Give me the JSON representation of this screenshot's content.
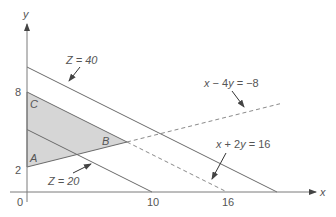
{
  "diagram": {
    "type": "linear-programming-feasible-region",
    "axes": {
      "x_label": "x",
      "y_label": "y",
      "origin_label": "0",
      "x_ticks": [
        "10",
        "16"
      ],
      "y_ticks": [
        "2",
        "8"
      ]
    },
    "vertices": [
      {
        "label": "A",
        "x": 0,
        "y": 2
      },
      {
        "label": "B",
        "x": 8,
        "y": 4
      },
      {
        "label": "C",
        "x": 0,
        "y": 8
      }
    ],
    "constraints": [
      {
        "label": "x − 4y = −8",
        "style": "solid-then-dashed"
      },
      {
        "label": "x + 2y = 16",
        "style": "solid-then-dashed"
      }
    ],
    "objective_lines": [
      {
        "label": "Z = 20"
      },
      {
        "label": "Z = 40"
      }
    ]
  }
}
